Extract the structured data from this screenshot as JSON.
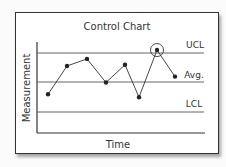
{
  "chart_data": {
    "type": "line",
    "title": "Control Chart",
    "xlabel": "Time",
    "ylabel": "Measurement",
    "reference_lines": [
      {
        "name": "UCL",
        "label": "UCL"
      },
      {
        "name": "Avg",
        "label": "Avg."
      },
      {
        "name": "LCL",
        "label": "LCL"
      }
    ],
    "x": [
      1,
      2,
      3,
      4,
      5,
      6,
      7,
      8
    ],
    "series": [
      {
        "name": "Measurement",
        "values": [
          0.3,
          0.78,
          0.9,
          0.5,
          0.8,
          0.25,
          1.05,
          0.6
        ]
      }
    ],
    "scale_note": "values relative: LCL=0, Avg=0.5, UCL=1",
    "annotations": [
      {
        "type": "circle",
        "point_index": 6,
        "meaning": "out-of-control point above UCL"
      }
    ],
    "grid": false,
    "legend": "none"
  },
  "colors": {
    "line": "#333333",
    "background": "#ffffff",
    "ref_line": "#555555"
  }
}
